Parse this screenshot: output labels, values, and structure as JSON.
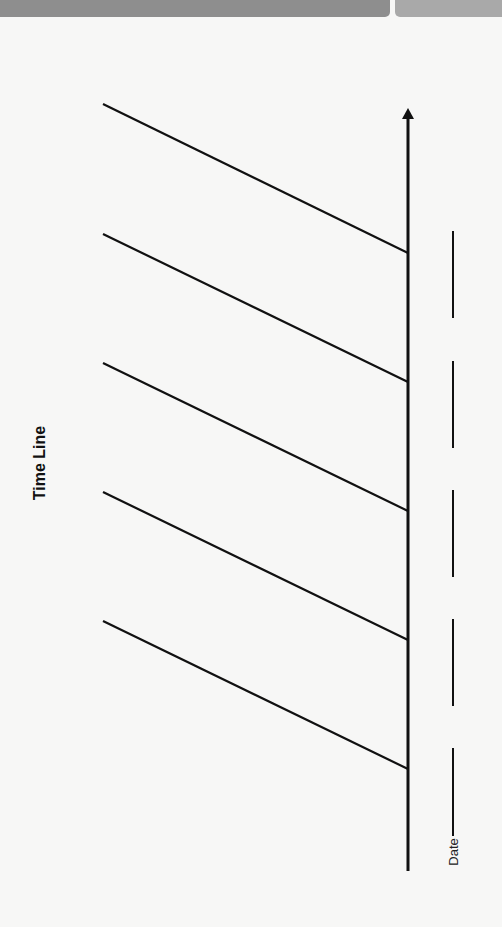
{
  "header": {
    "left_bar_color": "#8e8e8e",
    "right_bar_color": "#a9a9a9"
  },
  "diagram": {
    "title": "Time Line",
    "date_label": "Date",
    "axis": {
      "x": 408,
      "y_top": 108,
      "y_bottom": 871,
      "arrow": "up"
    },
    "branches": [
      {
        "x1": 103,
        "y1": 104,
        "x2": 408,
        "y2": 253
      },
      {
        "x1": 103,
        "y1": 234,
        "x2": 408,
        "y2": 382
      },
      {
        "x1": 103,
        "y1": 363,
        "x2": 408,
        "y2": 511
      },
      {
        "x1": 103,
        "y1": 492,
        "x2": 408,
        "y2": 640
      },
      {
        "x1": 103,
        "y1": 621,
        "x2": 408,
        "y2": 769
      }
    ],
    "date_segments": [
      {
        "x": 453,
        "y1": 231,
        "y2": 318
      },
      {
        "x": 453,
        "y1": 361,
        "y2": 448
      },
      {
        "x": 453,
        "y1": 490,
        "y2": 577
      },
      {
        "x": 453,
        "y1": 619,
        "y2": 706
      },
      {
        "x": 453,
        "y1": 748,
        "y2": 836
      }
    ],
    "line_color": "#111111"
  }
}
